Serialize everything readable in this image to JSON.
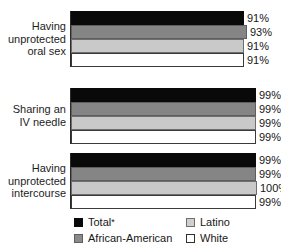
{
  "chart_data": {
    "type": "bar",
    "orientation": "horizontal",
    "title": "",
    "subtitle": "",
    "xlabel": "",
    "ylabel": "",
    "xlim": [
      0,
      100
    ],
    "grid": false,
    "legend_position": "bottom",
    "value_suffix": "%",
    "categories": [
      "Having unprotected oral sex",
      "Sharing an IV needle",
      "Having unprotected intercourse"
    ],
    "category_lines": [
      [
        "Having",
        "unprotected",
        "oral sex"
      ],
      [
        "Sharing an",
        "IV needle"
      ],
      [
        "Having",
        "unprotected",
        "intercourse"
      ]
    ],
    "series": [
      {
        "name": "Total*",
        "values": [
          91,
          99,
          99
        ],
        "color": "#090909"
      },
      {
        "name": "African-American",
        "values": [
          93,
          99,
          99
        ],
        "color": "#858585"
      },
      {
        "name": "Latino",
        "values": [
          91,
          99,
          100
        ],
        "color": "#c9c9c9"
      },
      {
        "name": "White",
        "values": [
          91,
          99,
          99
        ],
        "color": "#ffffff"
      }
    ],
    "value_labels": [
      [
        "91%",
        "93%",
        "91%",
        "91%"
      ],
      [
        "99%",
        "99%",
        "99%",
        "99%"
      ],
      [
        "99%",
        "99%",
        "100%",
        "99%"
      ]
    ]
  },
  "legend": {
    "items": [
      {
        "label": "Total",
        "footnote": "*"
      },
      {
        "label": "Latino",
        "footnote": ""
      },
      {
        "label": "African-American",
        "footnote": ""
      },
      {
        "label": "White",
        "footnote": ""
      }
    ]
  }
}
